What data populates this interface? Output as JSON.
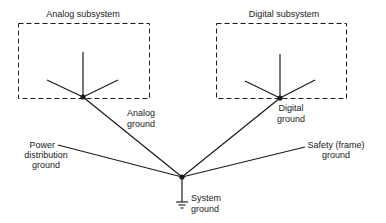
{
  "diagram": {
    "subsystems": [
      {
        "id": "analog",
        "title": "Analog subsystem"
      },
      {
        "id": "digital",
        "title": "Digital subsystem"
      }
    ],
    "labels": {
      "analog_ground_1": "Analog",
      "analog_ground_2": "ground",
      "digital_ground_1": "Digital",
      "digital_ground_2": "ground",
      "power_1": "Power",
      "power_2": "distribution",
      "power_3": "ground",
      "safety_1": "Safety (frame)",
      "safety_2": "ground",
      "system_1": "System",
      "system_2": "ground"
    },
    "colors": {
      "line": "#1a1a1a",
      "background": "#ffffff"
    }
  }
}
